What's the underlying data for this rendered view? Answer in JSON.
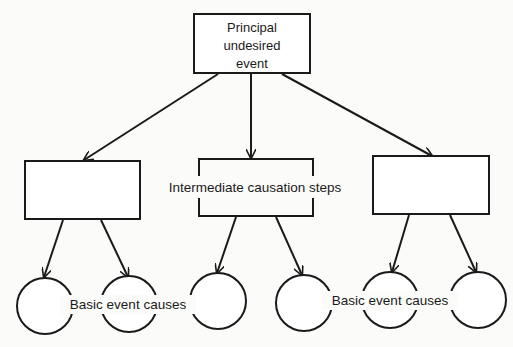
{
  "diagram": {
    "type": "fault-tree",
    "colors": {
      "ink": "#1a1a1a",
      "background": "#fbfbf9"
    },
    "top_event": {
      "lines": [
        "Principal",
        "undesired",
        "event"
      ]
    },
    "intermediate_label": "Intermediate causation steps",
    "intermediate_boxes": 3,
    "basic_labels": [
      "Basic event causes",
      "Basic event causes"
    ],
    "basic_circles": 6,
    "edges": [
      {
        "from": "top",
        "to": "intermediate-1"
      },
      {
        "from": "top",
        "to": "intermediate-2"
      },
      {
        "from": "top",
        "to": "intermediate-3"
      },
      {
        "from": "intermediate-1",
        "to": "basic-1"
      },
      {
        "from": "intermediate-1",
        "to": "basic-2"
      },
      {
        "from": "intermediate-2",
        "to": "basic-3"
      },
      {
        "from": "intermediate-2",
        "to": "basic-4"
      },
      {
        "from": "intermediate-3",
        "to": "basic-5"
      },
      {
        "from": "intermediate-3",
        "to": "basic-6"
      }
    ]
  }
}
